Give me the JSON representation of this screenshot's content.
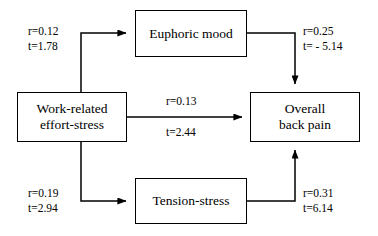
{
  "diagram": {
    "type": "path-diagram",
    "nodes": [
      {
        "id": "work",
        "label": "Work-related\neffort-stress"
      },
      {
        "id": "euphoric",
        "label": "Euphoric mood"
      },
      {
        "id": "tension",
        "label": "Tension-stress"
      },
      {
        "id": "overall",
        "label": "Overall\nback pain"
      }
    ],
    "edges": [
      {
        "id": "work-to-euphoric",
        "from": "work",
        "to": "euphoric",
        "r_label": "r=0.12",
        "t_label": "t=1.78",
        "label": "r=0.12\nt=1.78"
      },
      {
        "id": "euphoric-to-overall",
        "from": "euphoric",
        "to": "overall",
        "r_label": "r=0.25",
        "t_label": "t= - 5.14",
        "label": "r=0.25\nt= - 5.14"
      },
      {
        "id": "work-to-overall",
        "from": "work",
        "to": "overall",
        "r_label": "r=0.13",
        "t_label": "t=2.44"
      },
      {
        "id": "work-to-tension",
        "from": "work",
        "to": "tension",
        "r_label": "r=0.19",
        "t_label": "t=2.94",
        "label": "r=0.19\nt=2.94"
      },
      {
        "id": "tension-to-overall",
        "from": "tension",
        "to": "overall",
        "r_label": "r=0.31",
        "t_label": "t=6.14",
        "label": "r=0.31\nt=6.14"
      }
    ],
    "colors": {
      "stroke": "#000000",
      "background": "#ffffff",
      "text": "#000000"
    }
  }
}
